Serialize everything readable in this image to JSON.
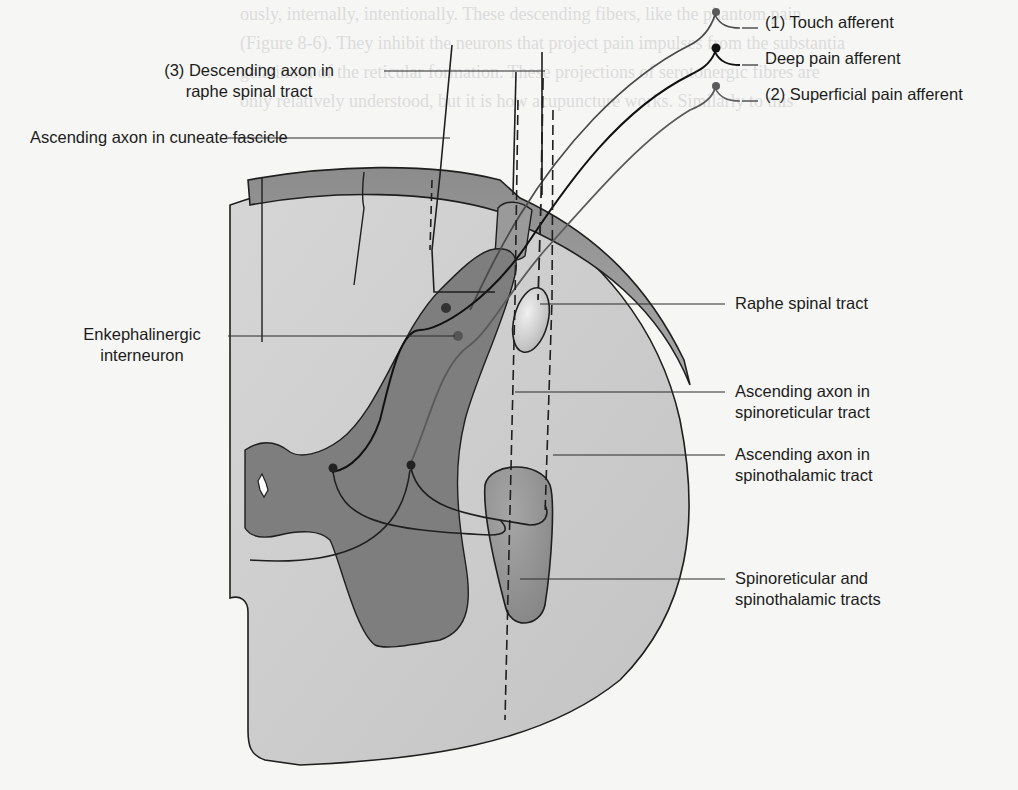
{
  "figure": {
    "type": "anatomical-diagram",
    "colors": {
      "background": "#f6f6f4",
      "white_matter": "#c9c9c9",
      "gray_matter": "#7e7e7e",
      "tract_fill": "#8a8a8a",
      "raphe_tract_fill": "#dedede",
      "line": "#1f1f1f",
      "afferent_touch": "#6a6a6a",
      "afferent_deep": "#111111",
      "afferent_superficial": "#5a5a5a",
      "faint_text": "#dcdcdc"
    }
  },
  "labels": {
    "touch_afferent": "(1) Touch afferent",
    "deep_pain_afferent": "Deep pain afferent",
    "superficial_pain_afferent": "(2) Superficial pain afferent",
    "descending_axon": [
      "(3) Descending axon in",
      "raphe spinal tract"
    ],
    "cuneate_fascicle": "Ascending axon in cuneate fascicle",
    "enkephalinergic": [
      "Enkephalinergic",
      "interneuron"
    ],
    "raphe_spinal_tract": "Raphe spinal tract",
    "spinoreticular_axon": [
      "Ascending axon in",
      "spinoreticular tract"
    ],
    "spinothalamic_axon": [
      "Ascending axon in",
      "spinothalamic tract"
    ],
    "tracts": [
      "Spinoreticular and",
      "spinothalamic tracts"
    ]
  },
  "background_text": [
    "ously, internally, intentionally. These descending fibers, like the phantom pain",
    "(Figure 8-6). They inhibit the neurons that project pain impulses from the substantia",
    "gelatinosa of the reticular formation. These projections of serotonergic fibres are",
    "only relatively understood, but it is how acupuncture works. Similarly to this",
    "",
    "",
    "",
    "",
    "",
    "",
    "",
    "",
    "",
    "",
    "",
    "",
    "",
    "",
    "",
    "",
    "",
    "",
    "also be mediated by the release of endorphins in the brain stem.",
    "Hypnosis can be highly effective in relieving pain in many pa-"
  ]
}
